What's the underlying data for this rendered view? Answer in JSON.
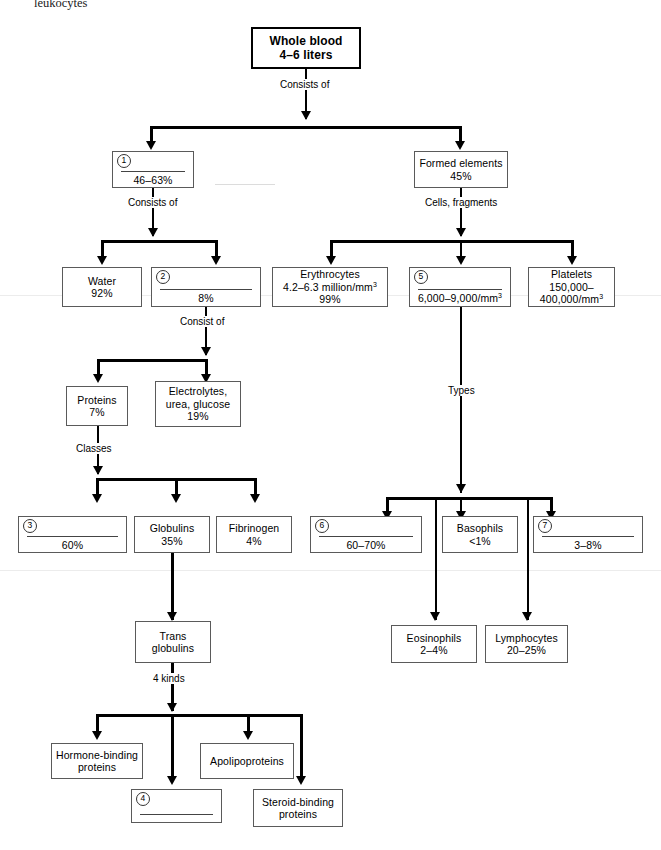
{
  "page": {
    "header_fragment": "leukocytes",
    "width": 661,
    "height": 850
  },
  "nodes": {
    "whole_blood": {
      "line1": "Whole blood",
      "line2": "4–6 liters"
    },
    "n1_plasma": {
      "number": "1",
      "value": "46–63%"
    },
    "formed_elements": {
      "line1": "Formed elements",
      "line2": "45%"
    },
    "water": {
      "line1": "Water",
      "line2": "92%"
    },
    "n2_solutes": {
      "number": "2",
      "value": "8%"
    },
    "erythrocytes": {
      "line1": "Erythrocytes",
      "line2": "4.2–6.3 million/mm",
      "line2_sup": "3",
      "line3": "99%"
    },
    "n5_leukocytes": {
      "number": "5",
      "value": "6,000–9,000/mm",
      "value_sup": "3"
    },
    "platelets": {
      "line1": "Platelets",
      "line2": "150,000–",
      "line3": "400,000/mm",
      "line3_sup": "3"
    },
    "proteins": {
      "line1": "Proteins",
      "line2": "7%"
    },
    "electrolytes": {
      "line1": "Electrolytes,",
      "line2": "urea, glucose",
      "line3": "19%"
    },
    "n3_albumins": {
      "number": "3",
      "value": "60%"
    },
    "globulins": {
      "line1": "Globulins",
      "line2": "35%"
    },
    "fibrinogen": {
      "line1": "Fibrinogen",
      "line2": "4%"
    },
    "n6_neutrophils": {
      "number": "6",
      "value": "60–70%"
    },
    "basophils": {
      "line1": "Basophils",
      "line2": "<1%"
    },
    "n7_monocytes": {
      "number": "7",
      "value": "3–8%"
    },
    "trans_globulins": {
      "line1": "Trans",
      "line2": "globulins"
    },
    "eosinophils": {
      "line1": "Eosinophils",
      "line2": "2–4%"
    },
    "lymphocytes": {
      "line1": "Lymphocytes",
      "line2": "20–25%"
    },
    "hormone_binding": {
      "line1": "Hormone-binding",
      "line2": "proteins"
    },
    "apolipoproteins": {
      "line1": "Apolipoproteins"
    },
    "n4_metal_binding": {
      "number": "4",
      "value": ""
    },
    "steroid_binding": {
      "line1": "Steroid-binding",
      "line2": "proteins"
    }
  },
  "edge_labels": {
    "consists_of_top": "Consists of",
    "consists_of_plasma": "Consists of",
    "cells_fragments": "Cells, fragments",
    "consist_of_solutes": "Consist of",
    "classes": "Classes",
    "types": "Types",
    "four_kinds": "4 kinds"
  },
  "colors": {
    "ink": "#000000",
    "box_border": "#5a5a5a",
    "heavy_border": "#000000",
    "background": "#ffffff"
  }
}
